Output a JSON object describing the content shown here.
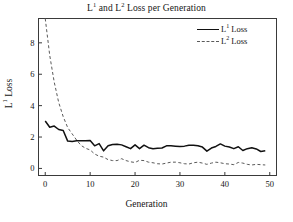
{
  "chart_data": {
    "type": "line",
    "title_parts": {
      "pre": "L",
      "sup1": "1",
      "mid": " and L",
      "sup2": "2",
      "post": " Loss per Generation"
    },
    "xlabel": "Generation",
    "ylabel": "L¹ Loss",
    "ylabel_parts": {
      "pre": "L",
      "sup": "1",
      "post": " Loss"
    },
    "xlim": [
      -1.5,
      51.5
    ],
    "ylim": [
      -0.45,
      9.55
    ],
    "xticks": [
      0,
      10,
      20,
      30,
      40,
      50
    ],
    "xtick_labels": [
      "0",
      "10",
      "20",
      "30",
      "40",
      "50"
    ],
    "yticks": [
      0,
      2,
      4,
      6,
      8
    ],
    "ytick_labels": [
      "0",
      "2",
      "4",
      "6",
      "8"
    ],
    "grid": false,
    "legend_position": "upper right",
    "colors": {
      "l1": "#111111",
      "l2": "#5a5a5a",
      "frame": "#3a3a3a",
      "background": "#ffffff"
    },
    "x": [
      0,
      1,
      2,
      3,
      4,
      5,
      6,
      7,
      8,
      9,
      10,
      11,
      12,
      13,
      14,
      15,
      16,
      17,
      18,
      19,
      20,
      21,
      22,
      23,
      24,
      25,
      26,
      27,
      28,
      29,
      30,
      31,
      32,
      33,
      34,
      35,
      36,
      37,
      38,
      39,
      40,
      41,
      42,
      43,
      44,
      45,
      46,
      47,
      48,
      49
    ],
    "series": [
      {
        "name": "L¹ Loss",
        "name_parts": {
          "pre": "L",
          "sup": "1",
          "post": " Loss"
        },
        "style": "solid",
        "color": "#111111",
        "values": [
          3.02,
          2.62,
          2.7,
          2.48,
          2.42,
          1.74,
          1.72,
          1.76,
          1.76,
          1.76,
          1.78,
          1.44,
          1.58,
          1.12,
          1.44,
          1.52,
          1.54,
          1.5,
          1.38,
          1.26,
          1.5,
          1.26,
          1.48,
          1.32,
          1.26,
          1.28,
          1.3,
          1.44,
          1.44,
          1.42,
          1.4,
          1.42,
          1.48,
          1.48,
          1.44,
          1.36,
          1.1,
          1.3,
          1.4,
          1.56,
          1.42,
          1.36,
          1.26,
          1.38,
          1.14,
          1.26,
          1.32,
          1.24,
          1.08,
          1.12
        ]
      },
      {
        "name": "L² Loss",
        "name_parts": {
          "pre": "L",
          "sup": "2",
          "post": " Loss"
        },
        "style": "dashed",
        "color": "#5a5a5a",
        "values": [
          9.55,
          7.2,
          5.5,
          4.2,
          3.3,
          2.6,
          2.2,
          1.8,
          1.46,
          1.28,
          1.18,
          0.92,
          0.78,
          0.72,
          0.56,
          0.5,
          0.5,
          0.62,
          0.5,
          0.42,
          0.38,
          0.52,
          0.5,
          0.4,
          0.36,
          0.3,
          0.28,
          0.34,
          0.4,
          0.4,
          0.36,
          0.3,
          0.28,
          0.36,
          0.4,
          0.34,
          0.26,
          0.34,
          0.4,
          0.36,
          0.3,
          0.28,
          0.24,
          0.38,
          0.34,
          0.26,
          0.22,
          0.26,
          0.24,
          0.22
        ]
      }
    ]
  },
  "legend": {
    "items": [
      {
        "label": "L1 Loss",
        "style": "solid"
      },
      {
        "label": "L2 Loss",
        "style": "dashed"
      }
    ]
  }
}
